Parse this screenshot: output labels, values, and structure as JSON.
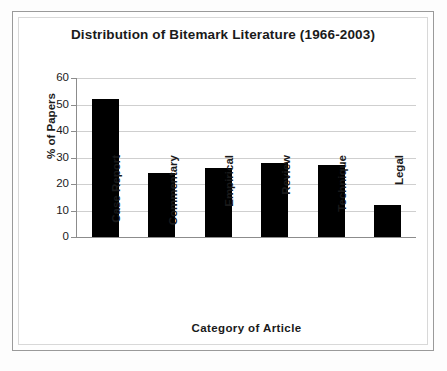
{
  "chart_data": {
    "type": "bar",
    "title": "Distribution of Bitemark Literature (1966-2003)",
    "xlabel": "Category of Article",
    "ylabel": "% of Papers",
    "categories": [
      "Case Report",
      "Commentary",
      "Empirical",
      "Review",
      "Technique",
      "Legal"
    ],
    "values": [
      52,
      24,
      26,
      28,
      27,
      12
    ],
    "ylim": [
      0,
      60
    ],
    "yticks": [
      0,
      10,
      20,
      30,
      40,
      50,
      60
    ],
    "ytick_labels": [
      "0",
      "10",
      "20",
      "30",
      "40",
      "50",
      "60"
    ],
    "grid": "horizontal",
    "legend": "none",
    "bar_color": "#000000",
    "gridline_color": "#cfcfcf",
    "axis_color": "#8c8c8c",
    "background_color": "#ffffff"
  }
}
